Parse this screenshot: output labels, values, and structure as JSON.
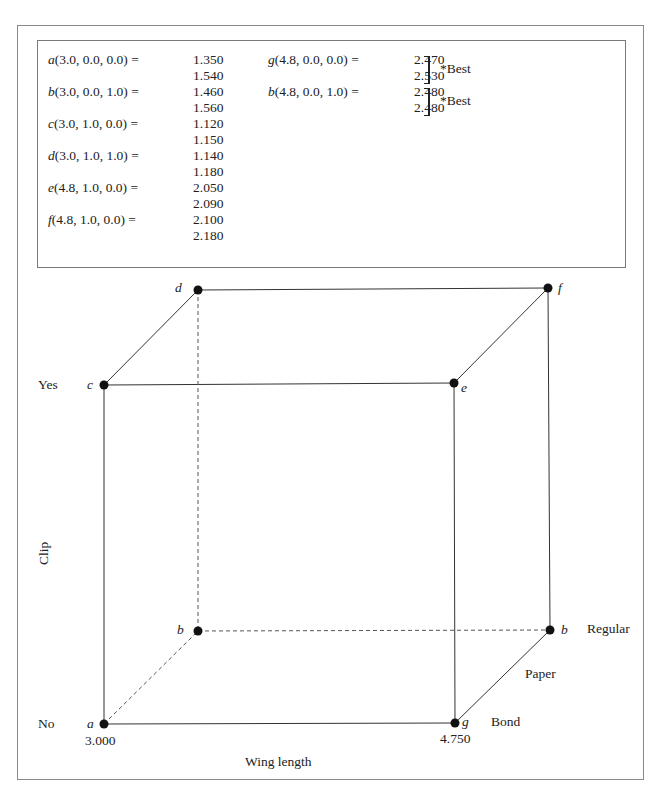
{
  "results": {
    "left": [
      {
        "point": "a",
        "coords": "(3.0, 0.0, 0.0)",
        "values": [
          "1.350",
          "1.540"
        ]
      },
      {
        "point": "b",
        "coords": "(3.0, 0.0, 1.0)",
        "values": [
          "1.460",
          "1.560"
        ]
      },
      {
        "point": "c",
        "coords": "(3.0, 1.0, 0.0)",
        "values": [
          "1.120",
          "1.150"
        ]
      },
      {
        "point": "d",
        "coords": "(3.0, 1.0, 1.0)",
        "values": [
          "1.140",
          "1.180"
        ]
      },
      {
        "point": "e",
        "coords": "(4.8, 1.0, 0.0)",
        "values": [
          "2.050",
          "2.090"
        ]
      },
      {
        "point": "f",
        "coords": "(4.8, 1.0, 0.0)",
        "values": [
          "2.100",
          "2.180"
        ]
      }
    ],
    "right": [
      {
        "point": "g",
        "coords": "(4.8, 0.0, 0.0)",
        "values": [
          "2.470",
          "2.530"
        ],
        "note": "*Best"
      },
      {
        "point": "b",
        "coords": "(4.8, 0.0, 1.0)",
        "values": [
          "2.480",
          "2.480"
        ],
        "note": "*Best"
      }
    ],
    "equals": "="
  },
  "cube": {
    "vertices": {
      "a": {
        "label": "a",
        "x": 104,
        "y": 724
      },
      "g": {
        "label": "g",
        "x": 455,
        "y": 723
      },
      "c": {
        "label": "c",
        "x": 104,
        "y": 385
      },
      "e": {
        "label": "e",
        "x": 454,
        "y": 383
      },
      "b": {
        "label": "b",
        "x": 198,
        "y": 631
      },
      "h": {
        "label": "b",
        "x": 550,
        "y": 630
      },
      "d": {
        "label": "d",
        "x": 198,
        "y": 290
      },
      "f": {
        "label": "f",
        "x": 548,
        "y": 288
      }
    },
    "axis_labels": {
      "clip": "Clip",
      "yes": "Yes",
      "no": "No",
      "wing_length": "Wing length",
      "wing_min": "3.000",
      "wing_max": "4.750",
      "paper": "Paper",
      "regular": "Regular",
      "bond": "Bond"
    }
  }
}
